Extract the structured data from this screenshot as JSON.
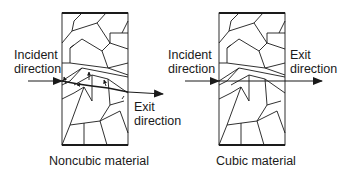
{
  "panels": [
    {
      "id": "noncubic",
      "caption": "Noncubic material",
      "incident_label": [
        "Incident",
        "direction"
      ],
      "exit_label": [
        "Exit",
        "direction"
      ]
    },
    {
      "id": "cubic",
      "caption": "Cubic material",
      "incident_label": [
        "Incident",
        "direction"
      ],
      "exit_label": [
        "Exit",
        "direction"
      ]
    }
  ],
  "colors": {
    "line": "#1a1a1a",
    "background": "#ffffff"
  }
}
